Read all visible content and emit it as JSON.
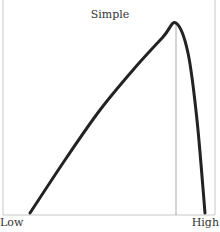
{
  "chart_data": {
    "type": "line",
    "title": "Simple",
    "xlabel": "",
    "ylabel": "",
    "x_tick_labels": [
      "Low",
      "High"
    ],
    "grid": false,
    "legend": null,
    "series": [
      {
        "name": "curve",
        "color": "#222222",
        "points_px": [
          [
            30,
            213
          ],
          [
            67,
            157
          ],
          [
            100,
            110
          ],
          [
            133,
            70
          ],
          [
            163,
            37
          ],
          [
            176,
            23
          ],
          [
            188,
            53
          ],
          [
            197,
            120
          ],
          [
            205,
            213
          ]
        ]
      }
    ],
    "annotations": [
      {
        "type": "vertical-line",
        "x_px": 176,
        "from_y_px": 23,
        "to_y_px": 215,
        "color": "#aaaaaa"
      }
    ],
    "frame": {
      "left_px": 3,
      "right_px": 215,
      "bottom_px": 215,
      "top": "none"
    }
  }
}
